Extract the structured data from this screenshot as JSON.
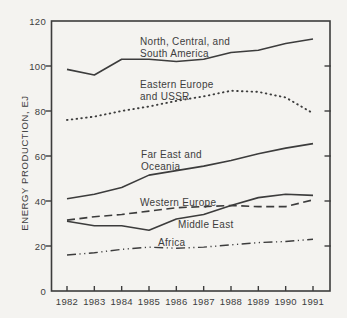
{
  "colors": {
    "ink": "#3c3c3c",
    "paper": "#f4f3f0"
  },
  "chart_data": {
    "type": "line",
    "title": "",
    "xlabel": "",
    "ylabel": "ENERGY PRODUCTION, EJ",
    "ylim": [
      0,
      120
    ],
    "y_ticks": [
      0,
      20,
      40,
      60,
      80,
      100,
      120
    ],
    "grid": "off",
    "legend": "inline-labels",
    "categories": [
      1982,
      1983,
      1984,
      1985,
      1986,
      1987,
      1988,
      1989,
      1990,
      1991
    ],
    "series": [
      {
        "name": "North, Central, and South America",
        "label_text": "North, Central, and\nSouth America",
        "line_style": "solid",
        "values": [
          98.5,
          96,
          103,
          103,
          102,
          103,
          106,
          107,
          110,
          112
        ]
      },
      {
        "name": "Eastern Europe and USSR",
        "label_text": "Eastern Europe\nand USSR",
        "line_style": "dotted",
        "values": [
          76,
          77.5,
          80,
          82,
          84.5,
          86.5,
          89,
          88.5,
          86,
          79
        ]
      },
      {
        "name": "Far East and Oceania",
        "label_text": "Far East and\nOceania",
        "line_style": "solid",
        "values": [
          41,
          43,
          46,
          51.5,
          53.5,
          55.5,
          58,
          61,
          63.5,
          65.5
        ]
      },
      {
        "name": "Western Europe",
        "label_text": "Western Europe",
        "line_style": "dashed",
        "values": [
          31.5,
          33,
          34,
          35.5,
          37,
          37.5,
          38,
          37.5,
          37.5,
          40.5
        ]
      },
      {
        "name": "Middle East",
        "label_text": "Middle East",
        "line_style": "solid",
        "values": [
          31,
          29,
          29,
          27,
          32,
          34,
          38,
          41.5,
          43,
          42.5
        ]
      },
      {
        "name": "Africa",
        "label_text": "Africa",
        "line_style": "dash-dot-dot",
        "values": [
          16,
          17,
          18.5,
          19.5,
          19,
          19.5,
          20.5,
          21.5,
          22,
          23
        ]
      }
    ]
  }
}
